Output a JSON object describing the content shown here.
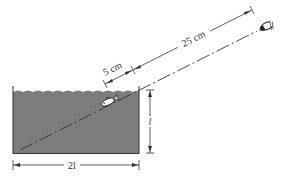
{
  "figure": {
    "type": "physics-optics-diagram",
    "labels": {
      "short_distance": "5 cm",
      "long_distance": "25 cm",
      "depth": "l",
      "width": "2l"
    },
    "colors": {
      "water": "#7a7a7a",
      "lines": "#333333",
      "background": "#ffffff"
    },
    "elements": {
      "tank": {
        "width_label": "2l",
        "depth_label": "l"
      },
      "fish": {
        "name": "fish"
      },
      "eye": {
        "name": "observer-eye"
      },
      "sight_line": {
        "style": "dash-dot"
      }
    }
  }
}
